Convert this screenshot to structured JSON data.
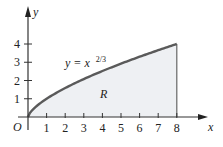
{
  "chart_data": {
    "type": "area",
    "title": "",
    "equation_label": "y = x",
    "equation_exponent": "2/3",
    "region_label": "R",
    "origin_label": "O",
    "xlabel": "x",
    "ylabel": "y",
    "x_ticks": [
      "1",
      "2",
      "3",
      "4",
      "5",
      "6",
      "7",
      "8"
    ],
    "y_ticks": [
      "1",
      "2",
      "3",
      "4"
    ],
    "xlim": [
      0,
      8.6
    ],
    "ylim": [
      0,
      4.5
    ],
    "function": "x^(2/3)",
    "shaded_interval": [
      0,
      8
    ],
    "x": [
      0,
      0.5,
      1,
      2,
      3,
      4,
      5,
      6,
      7,
      8
    ],
    "y": [
      0,
      0.63,
      1,
      1.59,
      2.08,
      2.52,
      2.92,
      3.3,
      3.66,
      4
    ],
    "grid": false,
    "colors": {
      "curve": "#555555",
      "fill": "#eef0f3",
      "axis": "#333333"
    }
  }
}
